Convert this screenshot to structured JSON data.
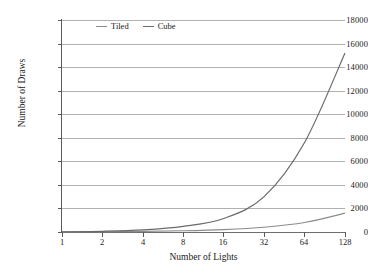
{
  "chart_data": {
    "type": "line",
    "title": "",
    "xlabel": "Number of Lights",
    "ylabel": "Number of Draws",
    "x": [
      1,
      2,
      4,
      8,
      16,
      32,
      64,
      128
    ],
    "xtick_labels": [
      "1",
      "2",
      "4",
      "8",
      "16",
      "32",
      "64",
      "128"
    ],
    "xscale": "log2",
    "xlim": [
      1,
      128
    ],
    "ylim": [
      0,
      18000
    ],
    "ytick_labels": [
      "0",
      "2000",
      "4000",
      "6000",
      "8000",
      "10000",
      "12000",
      "14000",
      "16000",
      "18000"
    ],
    "yticks": [
      0,
      2000,
      4000,
      6000,
      8000,
      10000,
      12000,
      14000,
      16000,
      18000
    ],
    "grid": "horizontal",
    "legend_position": "top-left-inside",
    "series": [
      {
        "name": "Tiled",
        "color": "#8c8c8c",
        "values": [
          12,
          25,
          50,
          100,
          200,
          400,
          800,
          1600
        ]
      },
      {
        "name": "Cube",
        "color": "#6a6a6a",
        "values": [
          16,
          60,
          180,
          480,
          1150,
          3000,
          7600,
          15200
        ]
      }
    ],
    "annotations": []
  },
  "legend": {
    "entries": [
      {
        "label": "Tiled",
        "color": "#8c8c8c"
      },
      {
        "label": "Cube",
        "color": "#6a6a6a"
      }
    ]
  },
  "axes": {
    "y_title": "Number of Draws",
    "x_title": "Number of Lights",
    "y_ticks": [
      "18000",
      "16000",
      "14000",
      "12000",
      "10000",
      "8000",
      "6000",
      "4000",
      "2000",
      "0"
    ],
    "x_ticks": [
      "1",
      "2",
      "4",
      "8",
      "16",
      "32",
      "64",
      "128"
    ]
  },
  "colors": {
    "grid": "#b0b0b0",
    "axis": "#5a5a5a",
    "text": "#1a1a1a",
    "background": "#ffffff"
  }
}
